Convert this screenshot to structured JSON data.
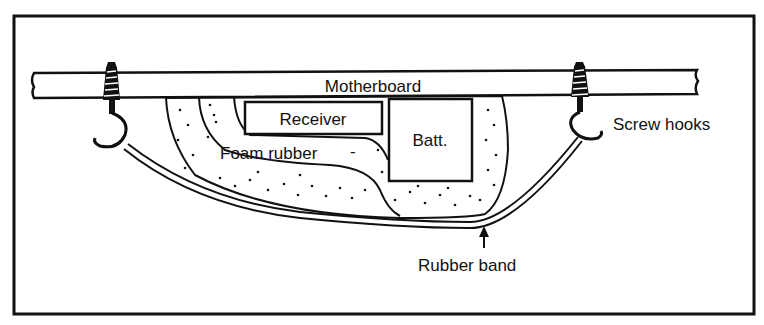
{
  "diagram": {
    "type": "mounting-schematic",
    "labels": {
      "motherboard": "Motherboard",
      "receiver": "Receiver",
      "battery": "Batt.",
      "foam": "Foam rubber",
      "foam_leader": "-",
      "screw_hooks": "Screw hooks",
      "rubber_band": "Rubber band"
    },
    "colors": {
      "ink": "#111111",
      "paper": "#ffffff"
    }
  }
}
